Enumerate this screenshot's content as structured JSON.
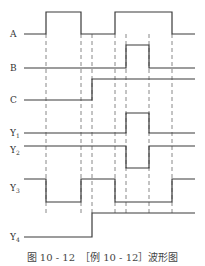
{
  "figure": {
    "caption": "图 10 - 12　［例 10 - 12］波形图",
    "caption_number": "图 10 - 12",
    "caption_title": "［例 10 - 12］波形图"
  },
  "diagram": {
    "type": "timing-waveform",
    "x_start": 24,
    "x_end": 195,
    "transition_x": [
      46,
      81,
      92,
      115,
      126,
      149,
      172
    ],
    "signals": [
      {
        "name": "A",
        "base": "A",
        "sub": "",
        "label_y": 34,
        "hi": 12,
        "lo": 34,
        "segments": [
          [
            24,
            0
          ],
          [
            46,
            1
          ],
          [
            81,
            0
          ],
          [
            115,
            1
          ],
          [
            172,
            0
          ]
        ]
      },
      {
        "name": "B",
        "base": "B",
        "sub": "",
        "label_y": 68,
        "hi": 45,
        "lo": 68,
        "segments": [
          [
            24,
            0
          ],
          [
            126,
            1
          ],
          [
            149,
            0
          ]
        ]
      },
      {
        "name": "C",
        "base": "C",
        "sub": "",
        "label_y": 100,
        "hi": 79,
        "lo": 100,
        "segments": [
          [
            24,
            0
          ],
          [
            92,
            1
          ]
        ]
      },
      {
        "name": "Y1",
        "base": "Y",
        "sub": "1",
        "label_y": 133,
        "hi": 113,
        "lo": 133,
        "segments": [
          [
            24,
            0
          ],
          [
            126,
            1
          ],
          [
            149,
            0
          ]
        ]
      },
      {
        "name": "Y2",
        "base": "Y",
        "sub": "2",
        "label_y": 150,
        "hi": 146,
        "lo": 168,
        "segments": [
          [
            24,
            1
          ],
          [
            126,
            0
          ],
          [
            149,
            1
          ]
        ]
      },
      {
        "name": "Y3",
        "base": "Y",
        "sub": "3",
        "label_y": 188,
        "hi": 179,
        "lo": 202,
        "segments": [
          [
            24,
            1
          ],
          [
            46,
            0
          ],
          [
            81,
            1
          ],
          [
            115,
            0
          ],
          [
            172,
            1
          ]
        ]
      },
      {
        "name": "Y4",
        "base": "Y",
        "sub": "4",
        "label_y": 237,
        "hi": 213,
        "lo": 237,
        "segments": [
          [
            24,
            0
          ],
          [
            92,
            1
          ]
        ]
      }
    ],
    "dash_top": 34,
    "dash_bottom": 213
  },
  "colors": {
    "line": "#3a3a3a",
    "dash": "#6a6a6a",
    "text": "#333333"
  }
}
